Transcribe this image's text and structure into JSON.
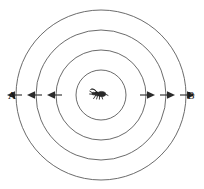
{
  "figure": {
    "background_color": "#ffffff",
    "width": 204,
    "height": 189,
    "center": {
      "x": 101,
      "y": 95
    },
    "wave_stroke_color": "#5a5a5a",
    "arrow_color": "#2b2b2b",
    "label_color": "#111111",
    "source": {
      "name": "insect-source",
      "description": "small insect (fly / mosquito) drawn at the common centre of the circles",
      "x": 98,
      "y": 94
    },
    "circles": [
      {
        "index": 1,
        "radius": 25,
        "label": "innermost-wavefront"
      },
      {
        "index": 2,
        "radius": 45,
        "label": "second-wavefront"
      },
      {
        "index": 3,
        "radius": 65,
        "label": "third-wavefront"
      },
      {
        "index": 4,
        "radius": 85,
        "label": "outermost-wavefront"
      }
    ],
    "labels": {
      "left": "A",
      "right": "B",
      "left_x": 12,
      "left_y": 98,
      "right_x": 188,
      "right_y": 98
    },
    "arrows": {
      "axis_y": 95,
      "left_direction": "left",
      "right_direction": "right",
      "left_segments": [
        {
          "from_x": 62,
          "to_x": 48
        },
        {
          "from_x": 42,
          "to_x": 28
        },
        {
          "from_x": 22,
          "to_x": 8
        }
      ],
      "right_segments": [
        {
          "from_x": 140,
          "to_x": 154
        },
        {
          "from_x": 160,
          "to_x": 174
        },
        {
          "from_x": 180,
          "to_x": 194
        }
      ]
    }
  }
}
